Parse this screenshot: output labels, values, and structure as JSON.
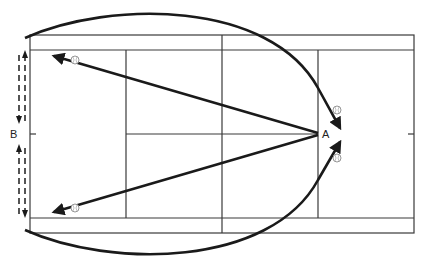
{
  "diagram": {
    "type": "tennis-court-drill",
    "labels": {
      "point_a": "A",
      "point_b": "B"
    },
    "elements": {
      "court": "tennis-court-top-view",
      "shots_from_a": [
        "to-left-top-corner",
        "to-left-bottom-corner"
      ],
      "movement_arcs": [
        "top-arc-to-a",
        "bottom-arc-to-a"
      ],
      "player_movement_at_b": [
        "dashed-up-down-top",
        "dashed-up-down-bottom"
      ],
      "ball_icons": 4
    },
    "colors": {
      "line": "#3a3a3a",
      "arrow": "#1a1a1a",
      "background": "#ffffff"
    }
  }
}
